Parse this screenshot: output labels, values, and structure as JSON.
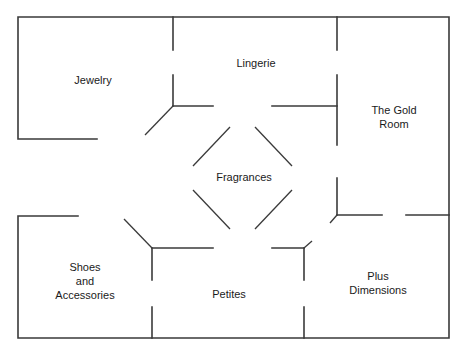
{
  "diagram": {
    "type": "floor-plan",
    "rooms": [
      {
        "id": "jewelry",
        "label": "Jewelry",
        "x": 93,
        "y": 80
      },
      {
        "id": "lingerie",
        "label": "Lingerie",
        "x": 256,
        "y": 63
      },
      {
        "id": "gold-room",
        "label": "The Gold\nRoom",
        "line1": "The Gold",
        "line2": "Room",
        "x": 394,
        "y": 117
      },
      {
        "id": "fragrances",
        "label": "Fragrances",
        "x": 244,
        "y": 177
      },
      {
        "id": "shoes-accessories",
        "label": "Shoes\nand\nAccessories",
        "line1": "Shoes",
        "line2": "and",
        "line3": "Accessories",
        "x": 85,
        "y": 281
      },
      {
        "id": "petites",
        "label": "Petites",
        "x": 229,
        "y": 294
      },
      {
        "id": "plus-dimensions",
        "label": "Plus\nDimensions",
        "line1": "Plus",
        "line2": "Dimensions",
        "x": 378,
        "y": 283
      }
    ],
    "line_color": "#3a3a3a",
    "background": "#ffffff"
  }
}
